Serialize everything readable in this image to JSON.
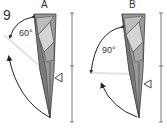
{
  "step_number": "9",
  "panels": [
    {
      "label": "A",
      "angle": "60°"
    },
    {
      "label": "B",
      "angle": "90°"
    }
  ],
  "colors": {
    "outline": "#3a3a3a",
    "dark_fill": "#7a7a7a",
    "mid_fill": "#a8a8a8",
    "light_fill": "#d4d4d4",
    "measure_line": "#555555",
    "guide_line": "#e2e2e2"
  }
}
